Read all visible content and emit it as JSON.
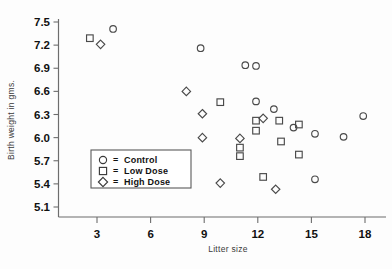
{
  "chart_data": {
    "type": "scatter",
    "title": "",
    "xlabel": "Litter size",
    "ylabel": "Birth weight in gms.",
    "xlim": [
      1.0,
      18.9
    ],
    "ylim": [
      4.95,
      7.62
    ],
    "xticks": [
      3,
      6,
      9,
      12,
      15,
      18
    ],
    "xtick_labels": [
      "3",
      "6",
      "9",
      "12",
      "15",
      "18"
    ],
    "yticks": [
      5.1,
      5.4,
      5.7,
      6.0,
      6.3,
      6.6,
      6.9,
      7.2,
      7.5
    ],
    "ytick_labels": [
      "5.1",
      "5.4",
      "5.7",
      "6.0",
      "6.3",
      "6.6",
      "6.9",
      "7.2",
      "7.5"
    ],
    "grid": false,
    "legend_position": "lower-left",
    "series": [
      {
        "name": "Control",
        "marker": "circle",
        "color": "#4a4a4a",
        "points": [
          [
            3.9,
            7.41
          ],
          [
            8.8,
            7.16
          ],
          [
            11.3,
            6.94
          ],
          [
            11.9,
            6.93
          ],
          [
            11.9,
            6.47
          ],
          [
            12.9,
            6.37
          ],
          [
            14.0,
            6.13
          ],
          [
            15.2,
            6.05
          ],
          [
            16.8,
            6.01
          ],
          [
            15.2,
            5.46
          ],
          [
            17.9,
            6.28
          ]
        ]
      },
      {
        "name": "Low Dose",
        "marker": "square",
        "color": "#4a4a4a",
        "points": [
          [
            2.6,
            7.29
          ],
          [
            9.9,
            6.46
          ],
          [
            11.9,
            6.22
          ],
          [
            11.9,
            6.09
          ],
          [
            11.0,
            5.87
          ],
          [
            11.0,
            5.76
          ],
          [
            13.2,
            6.22
          ],
          [
            14.3,
            6.17
          ],
          [
            13.3,
            5.95
          ],
          [
            14.3,
            5.78
          ],
          [
            12.3,
            5.49
          ]
        ]
      },
      {
        "name": "High Dose",
        "marker": "diamond",
        "color": "#4a4a4a",
        "points": [
          [
            3.2,
            7.21
          ],
          [
            8.0,
            6.6
          ],
          [
            8.9,
            6.31
          ],
          [
            8.9,
            6.0
          ],
          [
            9.9,
            5.41
          ],
          [
            11.0,
            5.99
          ],
          [
            13.0,
            5.33
          ],
          [
            12.3,
            6.25
          ]
        ]
      }
    ]
  },
  "axes": {
    "x_title": "Litter size",
    "y_title": "Birth weight in gms."
  },
  "legend": {
    "entries": [
      {
        "marker": "circle",
        "equals": "=",
        "label": "Control"
      },
      {
        "marker": "square",
        "equals": "=",
        "label": "Low Dose"
      },
      {
        "marker": "diamond",
        "equals": "=",
        "label": "High Dose"
      }
    ]
  }
}
